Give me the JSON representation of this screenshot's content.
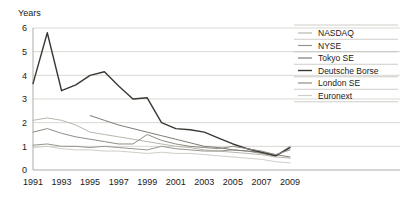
{
  "chart_data": {
    "type": "line",
    "title": "",
    "subtitle": "",
    "xlabel": "",
    "ylabel": "Years",
    "ylim": [
      0,
      6
    ],
    "xlim": [
      1991,
      2009
    ],
    "grid": true,
    "legend_position": "right",
    "y_ticks": [
      "0",
      "1",
      "2",
      "3",
      "4",
      "5",
      "6"
    ],
    "y_tick_values": [
      0,
      1,
      2,
      3,
      4,
      5,
      6
    ],
    "x_ticks": [
      "1991",
      "1993",
      "1995",
      "1997",
      "1999",
      "2001",
      "2003",
      "2005",
      "2007",
      "2009"
    ],
    "x_tick_values": [
      1991,
      1993,
      1995,
      1997,
      1999,
      2001,
      2003,
      2005,
      2007,
      2009
    ],
    "x": [
      1991,
      1992,
      1993,
      1994,
      1995,
      1996,
      1997,
      1998,
      1999,
      2000,
      2001,
      2002,
      2003,
      2004,
      2005,
      2006,
      2007,
      2008,
      2009
    ],
    "series": [
      {
        "name": "NASDAQ",
        "color": "#b8b6ae",
        "width": 1.0,
        "x": [
          1991,
          1992,
          1993,
          1994,
          1995,
          1996,
          1997,
          1998,
          1999,
          2000,
          2001,
          2002,
          2003,
          2004,
          2005,
          2006,
          2007,
          2008,
          2009
        ],
        "values": [
          2.1,
          2.2,
          2.1,
          1.9,
          1.6,
          1.5,
          1.4,
          1.3,
          1.2,
          1.1,
          1.0,
          0.95,
          0.85,
          0.8,
          0.75,
          0.7,
          0.65,
          0.55,
          0.5
        ]
      },
      {
        "name": "NYSE",
        "color": "#97958d",
        "width": 1.0,
        "x": [
          1991,
          1992,
          1993,
          1994,
          1995,
          1996,
          1997,
          1998,
          1999,
          2000,
          2001,
          2002,
          2003,
          2004,
          2005,
          2006,
          2007,
          2008,
          2009
        ],
        "values": [
          1.05,
          1.1,
          1.0,
          1.0,
          0.95,
          1.0,
          0.95,
          0.9,
          0.85,
          1.0,
          0.9,
          0.85,
          0.8,
          0.8,
          0.85,
          0.8,
          0.7,
          0.6,
          1.0
        ]
      },
      {
        "name": "Tokyo SE",
        "color": "#7d7b74",
        "width": 1.0,
        "x": [
          1995,
          1996,
          1997,
          1998,
          1999,
          2000,
          2001,
          2002,
          2003,
          2004,
          2005,
          2006,
          2007,
          2008,
          2009
        ],
        "values": [
          2.3,
          2.1,
          1.9,
          1.75,
          1.6,
          1.45,
          1.3,
          1.15,
          1.0,
          0.95,
          0.85,
          0.8,
          0.75,
          0.65,
          0.55
        ]
      },
      {
        "name": "Deutsche Borse",
        "color": "#3a3833",
        "width": 1.4,
        "x": [
          1991,
          1992,
          1993,
          1994,
          1995,
          1996,
          1997,
          1998,
          1999,
          2000,
          2001,
          2002,
          2003,
          2004,
          2005,
          2006,
          2007,
          2008,
          2009
        ],
        "values": [
          3.65,
          5.8,
          3.35,
          3.6,
          4.0,
          4.15,
          3.55,
          3.0,
          3.05,
          2.0,
          1.75,
          1.7,
          1.6,
          1.35,
          1.1,
          0.9,
          0.75,
          0.6,
          0.95
        ]
      },
      {
        "name": "London SE",
        "color": "#8e8c84",
        "width": 1.0,
        "x": [
          1991,
          1992,
          1993,
          1994,
          1995,
          1996,
          1997,
          1998,
          1999,
          2000,
          2001,
          2002,
          2003,
          2004,
          2005,
          2006,
          2007,
          2008,
          2009
        ],
        "values": [
          1.6,
          1.75,
          1.55,
          1.4,
          1.3,
          1.2,
          1.1,
          1.1,
          1.5,
          1.25,
          1.1,
          1.0,
          0.95,
          0.9,
          1.0,
          0.9,
          0.8,
          0.65,
          0.85
        ]
      },
      {
        "name": "Euronext",
        "color": "#cfcdc6",
        "width": 1.0,
        "x": [
          1991,
          1992,
          1993,
          1994,
          1995,
          1996,
          1997,
          1998,
          1999,
          2000,
          2001,
          2002,
          2003,
          2004,
          2005,
          2006,
          2007,
          2008,
          2009
        ],
        "values": [
          0.95,
          1.0,
          0.9,
          0.85,
          0.85,
          0.8,
          0.8,
          0.75,
          0.7,
          0.75,
          0.7,
          0.7,
          0.65,
          0.6,
          0.55,
          0.5,
          0.45,
          0.35,
          0.3
        ]
      }
    ]
  },
  "axis": {
    "y_title": "Years"
  },
  "legend": {
    "items": [
      {
        "label": "NASDAQ"
      },
      {
        "label": "NYSE"
      },
      {
        "label": "Tokyo SE"
      },
      {
        "label": "Deutsche Borse"
      },
      {
        "label": "London SE"
      },
      {
        "label": "Euronext"
      }
    ]
  }
}
